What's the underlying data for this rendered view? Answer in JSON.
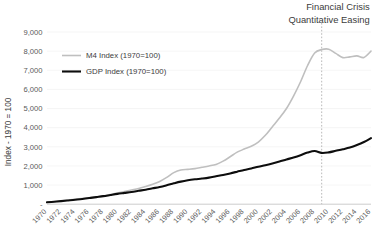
{
  "chart_data": {
    "type": "line",
    "title": "",
    "xlabel": "",
    "ylabel": "Index - 1970 = 100",
    "ylim": [
      0,
      9000
    ],
    "xlim": [
      1970,
      2016
    ],
    "grid": true,
    "legend_position": "upper-left-inside",
    "y_ticks": [
      "-",
      "1,000",
      "2,000",
      "3,000",
      "4,000",
      "5,000",
      "6,000",
      "7,000",
      "8,000",
      "9,000"
    ],
    "y_tick_values": [
      0,
      1000,
      2000,
      3000,
      4000,
      5000,
      6000,
      7000,
      8000,
      9000
    ],
    "x_tick_labels": [
      "1970",
      "1972",
      "1974",
      "1976",
      "1978",
      "1980",
      "1982",
      "1984",
      "1986",
      "1988",
      "1990",
      "1992",
      "1994",
      "1996",
      "1998",
      "2000",
      "2002",
      "2004",
      "2006",
      "2008",
      "2010",
      "2012",
      "2014",
      "2016"
    ],
    "x": [
      1970,
      1971,
      1972,
      1973,
      1974,
      1975,
      1976,
      1977,
      1978,
      1979,
      1980,
      1981,
      1982,
      1983,
      1984,
      1985,
      1986,
      1987,
      1988,
      1989,
      1990,
      1991,
      1992,
      1993,
      1994,
      1995,
      1996,
      1997,
      1998,
      1999,
      2000,
      2001,
      2002,
      2003,
      2004,
      2005,
      2006,
      2007,
      2008,
      2009,
      2010,
      2011,
      2012,
      2013,
      2014,
      2015,
      2016
    ],
    "series": [
      {
        "name": "M4 Index (1970=100)",
        "color": "#bfbfbf",
        "width": 1.6,
        "values": [
          100,
          130,
          170,
          220,
          260,
          300,
          340,
          380,
          430,
          500,
          580,
          660,
          740,
          820,
          920,
          1040,
          1190,
          1400,
          1650,
          1790,
          1820,
          1860,
          1930,
          2000,
          2080,
          2250,
          2480,
          2720,
          2880,
          3030,
          3250,
          3600,
          4050,
          4500,
          5000,
          5650,
          6400,
          7250,
          7900,
          8080,
          8100,
          7880,
          7660,
          7700,
          7750,
          7670,
          8000
        ]
      },
      {
        "name": "GDP Index (1970=100)",
        "color": "#0d0d0d",
        "width": 2.1,
        "values": [
          100,
          130,
          160,
          195,
          230,
          275,
          320,
          370,
          420,
          480,
          540,
          590,
          640,
          700,
          760,
          830,
          900,
          990,
          1090,
          1180,
          1250,
          1300,
          1340,
          1390,
          1460,
          1530,
          1610,
          1700,
          1790,
          1870,
          1960,
          2040,
          2130,
          2230,
          2340,
          2440,
          2560,
          2700,
          2780,
          2680,
          2710,
          2790,
          2870,
          2960,
          3090,
          3250,
          3450
        ]
      }
    ],
    "annotations": [
      {
        "name": "financial-crisis-qe",
        "lines": [
          "Financial Crisis",
          "Quantitative Easing"
        ],
        "x_value": 2009,
        "marker": "dashed-vertical-line",
        "marker_color": "#a6a6a6"
      }
    ]
  }
}
